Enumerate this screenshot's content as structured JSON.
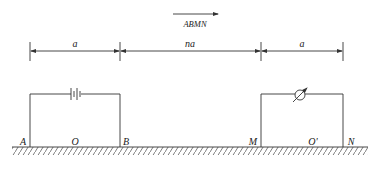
{
  "direction": {
    "label": "ABMN",
    "arrow_direction": "right"
  },
  "dimensions": [
    {
      "label": "a",
      "from": "A",
      "to": "B"
    },
    {
      "label": "na",
      "from": "B",
      "to": "M"
    },
    {
      "label": "a",
      "from": "M",
      "to": "N"
    }
  ],
  "electrodes": {
    "A": "A",
    "O": "O",
    "B": "B",
    "M": "M",
    "O_prime": "O'",
    "N": "N"
  },
  "components": {
    "source": {
      "type": "battery-icon",
      "circuit": "AB"
    },
    "meter": {
      "type": "meter-icon",
      "circuit": "MN"
    }
  },
  "ground": {
    "type": "hatched-ground"
  },
  "colors": {
    "line": "#333333",
    "text": "#222222",
    "background": "#ffffff"
  }
}
